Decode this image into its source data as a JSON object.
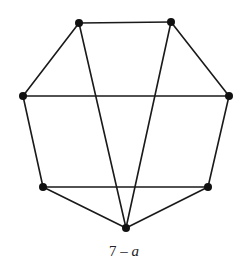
{
  "diagram": {
    "type": "graph",
    "caption": {
      "number": "7",
      "separator": " – ",
      "variable": "a"
    },
    "style": {
      "edge_color": "#1a1a1a",
      "node_color": "#111111",
      "edge_width": 1.6,
      "node_radius": 4
    },
    "nodes": [
      {
        "id": "top-left",
        "x": 79,
        "y": 23
      },
      {
        "id": "top-right",
        "x": 171,
        "y": 22
      },
      {
        "id": "left",
        "x": 23,
        "y": 96
      },
      {
        "id": "right",
        "x": 229,
        "y": 96
      },
      {
        "id": "bottom-left",
        "x": 43,
        "y": 187
      },
      {
        "id": "bottom-right",
        "x": 208,
        "y": 187
      },
      {
        "id": "bottom",
        "x": 126,
        "y": 228
      }
    ],
    "edges": [
      [
        "top-left",
        "top-right"
      ],
      [
        "top-left",
        "left"
      ],
      [
        "top-right",
        "right"
      ],
      [
        "left",
        "right"
      ],
      [
        "left",
        "bottom-left"
      ],
      [
        "right",
        "bottom-right"
      ],
      [
        "bottom-left",
        "bottom-right"
      ],
      [
        "bottom-left",
        "bottom"
      ],
      [
        "bottom-right",
        "bottom"
      ],
      [
        "top-left",
        "bottom"
      ],
      [
        "top-right",
        "bottom"
      ]
    ]
  }
}
